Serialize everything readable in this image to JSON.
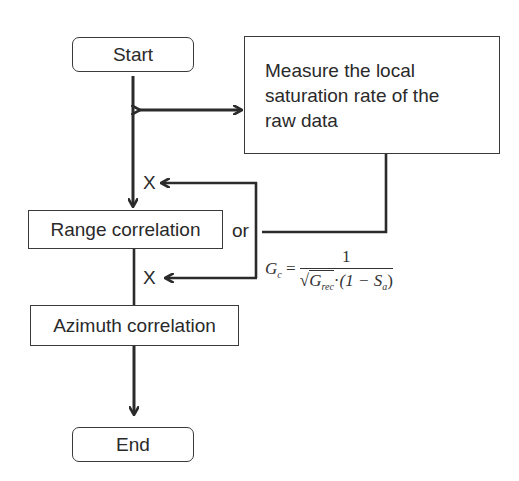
{
  "nodes": {
    "start": "Start",
    "measure": "Measure the local saturation rate of the raw data",
    "measure_lines": [
      "Measure the local",
      "saturation rate of the",
      "raw data"
    ],
    "range": "Range correlation",
    "azimuth": "Azimuth correlation",
    "end": "End"
  },
  "labels": {
    "multiply_top": "X",
    "multiply_bottom": "X",
    "or": "or"
  },
  "formula": {
    "lhs": "G",
    "lhs_sub": "c",
    "eq": "=",
    "numerator": "1",
    "sqrt_symbol": "√",
    "g_rec": "G",
    "g_rec_sub": "rec",
    "dot": "·",
    "paren_open": "(1 − S",
    "s_sub": "a",
    "paren_close": ")",
    "text": "G_c = 1 / (sqrt(G_rec) · (1 − S_a))"
  },
  "colors": {
    "line": "#2b2b2b",
    "border": "#3a3a3a",
    "background": "#ffffff"
  }
}
